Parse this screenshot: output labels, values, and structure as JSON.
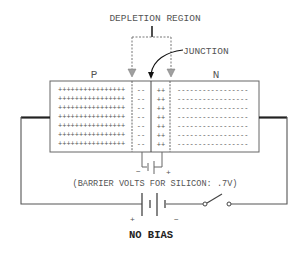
{
  "diagram": {
    "title": "NO BIAS",
    "labels": {
      "depletion_region": "DEPLETION REGION",
      "junction": "JUNCTION",
      "p_side": "P",
      "n_side": "N",
      "barrier_note": "(BARRIER VOLTS FOR SILICON: .7V)"
    },
    "p_region": {
      "rows": [
        "++++++++++++++++",
        "++++++++++++++++",
        "++++++++++++++++",
        "++++++++++++++++",
        "++++++++++++++++",
        "++++++++++++++++",
        "++++++++++++++++"
      ]
    },
    "depletion_p": {
      "rows": [
        "--",
        "--",
        "--",
        "--",
        "--",
        "--",
        "--"
      ]
    },
    "depletion_n": {
      "rows": [
        "++",
        "++",
        "++",
        "++",
        "++",
        "++",
        "++"
      ]
    },
    "n_region": {
      "rows": [
        "-----------------",
        "-----------------",
        "-----------------",
        "-----------------",
        "-----------------",
        "-----------------",
        "-----------------"
      ]
    },
    "barrier_battery": {
      "minus": "−",
      "plus": "+"
    },
    "source_battery": {
      "plus": "+",
      "minus": "−"
    },
    "switch": {
      "state": "open"
    },
    "colors": {
      "line": "#555555",
      "wire_thick": "#222222",
      "text": "#555555",
      "arrow_gray": "#999999",
      "title": "#222222"
    }
  }
}
